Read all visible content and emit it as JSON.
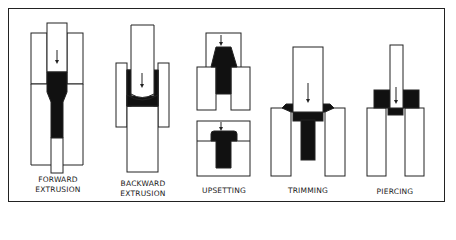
{
  "figure": {
    "colors": {
      "material": "#111111",
      "tool": "#ffffff",
      "outline": "#222222"
    },
    "panels": [
      {
        "id": "forward-extrusion",
        "label_line1": "FORWARD",
        "label_line2": "EXTRUSION"
      },
      {
        "id": "backward-extrusion",
        "label_line1": "BACKWARD",
        "label_line2": "EXTRUSION"
      },
      {
        "id": "upsetting",
        "label_line1": "UPSETTING",
        "label_line2": ""
      },
      {
        "id": "trimming",
        "label_line1": "TRIMMING",
        "label_line2": ""
      },
      {
        "id": "piercing",
        "label_line1": "PIERCING",
        "label_line2": ""
      }
    ]
  }
}
